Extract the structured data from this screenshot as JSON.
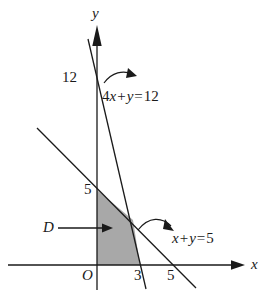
{
  "figure": {
    "type": "linear-programming-feasible-region-diagram",
    "background_color": "#ffffff",
    "line_color": "#1a1a1a",
    "shade_color": "#a8a8a8"
  },
  "axes": {
    "x_label": "x",
    "y_label": "y",
    "origin_label": "O"
  },
  "ticks": {
    "y": [
      {
        "label": "12",
        "value": 12
      },
      {
        "label": "5",
        "value": 5
      }
    ],
    "x": [
      {
        "label": "3",
        "value": 3
      },
      {
        "label": "5",
        "value": 5
      }
    ]
  },
  "lines": [
    {
      "name": "line-4x-plus-y-equals-12",
      "equation_parts": {
        "coef": "4",
        "var1": "x",
        "op1": "+",
        "var2": "y",
        "eq": "=",
        "rhs": "12"
      },
      "equation_text": "4x + y = 12",
      "x_intercept": 3,
      "y_intercept": 12
    },
    {
      "name": "line-x-plus-y-equals-5",
      "equation_parts": {
        "coef": "",
        "var1": "x",
        "op1": "+",
        "var2": "y",
        "eq": "=",
        "rhs": "5"
      },
      "equation_text": "x + y = 5",
      "x_intercept": 5,
      "y_intercept": 5
    }
  ],
  "region": {
    "label": "D",
    "description": "feasible region",
    "vertices": [
      [
        0,
        0
      ],
      [
        0,
        5
      ],
      [
        2.333,
        2.667
      ],
      [
        3,
        0
      ]
    ]
  }
}
